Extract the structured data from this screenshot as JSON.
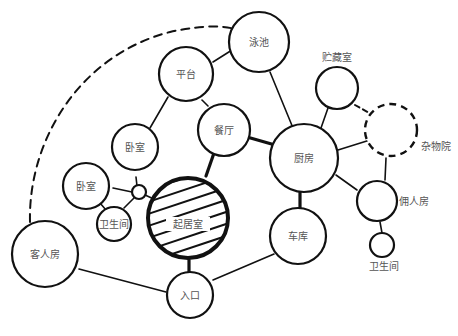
{
  "diagram": {
    "type": "bubble-diagram",
    "nodes": [
      {
        "id": "pool",
        "label": "泳池"
      },
      {
        "id": "terrace",
        "label": "平台"
      },
      {
        "id": "storage",
        "label": "贮藏室"
      },
      {
        "id": "yard",
        "label": "杂物院"
      },
      {
        "id": "dining",
        "label": "餐厅"
      },
      {
        "id": "bedroom1",
        "label": "卧室"
      },
      {
        "id": "bedroom2",
        "label": "卧室"
      },
      {
        "id": "kitchen",
        "label": "厨房"
      },
      {
        "id": "living",
        "label": "起居室"
      },
      {
        "id": "bath1",
        "label": "卫生间"
      },
      {
        "id": "servant",
        "label": "佣人房"
      },
      {
        "id": "bath2",
        "label": "卫生间"
      },
      {
        "id": "guest",
        "label": "客人房"
      },
      {
        "id": "garage",
        "label": "车库"
      },
      {
        "id": "entrance",
        "label": "入口"
      }
    ],
    "edges": [
      {
        "from": "terrace",
        "to": "pool",
        "style": "thin"
      },
      {
        "from": "terrace",
        "to": "dining",
        "style": "thin"
      },
      {
        "from": "terrace",
        "to": "bedroom1",
        "style": "thin"
      },
      {
        "from": "pool",
        "to": "kitchen",
        "style": "thin"
      },
      {
        "from": "dining",
        "to": "kitchen",
        "style": "thick"
      },
      {
        "from": "dining",
        "to": "living",
        "style": "thick"
      },
      {
        "from": "storage",
        "to": "kitchen",
        "style": "thin"
      },
      {
        "from": "storage",
        "to": "yard",
        "style": "dashed"
      },
      {
        "from": "kitchen",
        "to": "yard",
        "style": "thin"
      },
      {
        "from": "kitchen",
        "to": "servant",
        "style": "thin"
      },
      {
        "from": "kitchen",
        "to": "garage",
        "style": "thick"
      },
      {
        "from": "yard",
        "to": "servant",
        "style": "thin"
      },
      {
        "from": "servant",
        "to": "bath2",
        "style": "thin"
      },
      {
        "from": "bedroom1",
        "to": "hub",
        "style": "thin"
      },
      {
        "from": "bedroom2",
        "to": "hub",
        "style": "thin"
      },
      {
        "from": "bath1",
        "to": "hub",
        "style": "thin"
      },
      {
        "from": "hub",
        "to": "living",
        "style": "thin"
      },
      {
        "from": "bedroom2",
        "to": "bath1",
        "style": "thin"
      },
      {
        "from": "living",
        "to": "entrance",
        "style": "thick"
      },
      {
        "from": "guest",
        "to": "entrance",
        "style": "thin"
      },
      {
        "from": "garage",
        "to": "entrance",
        "style": "thin"
      },
      {
        "from": "guest",
        "to": "pool",
        "style": "dashed"
      }
    ]
  }
}
